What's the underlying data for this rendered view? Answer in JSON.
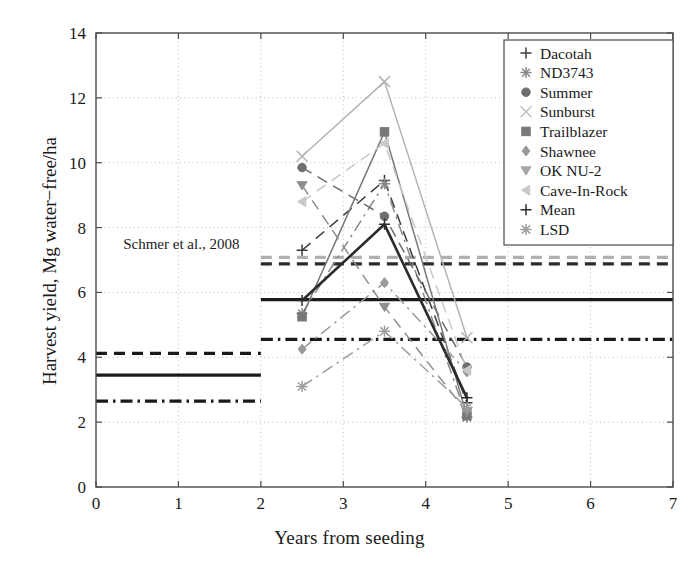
{
  "chart_data": {
    "type": "line",
    "title": "",
    "xlabel": "Years from seeding",
    "ylabel": "Harvest yield, Mg water−free/ha",
    "xlim": [
      0,
      7
    ],
    "ylim": [
      0,
      14
    ],
    "xticks": [
      "0",
      "1",
      "2",
      "3",
      "4",
      "5",
      "6",
      "7"
    ],
    "yticks": [
      "0",
      "2",
      "4",
      "6",
      "8",
      "10",
      "12",
      "14"
    ],
    "xtick_values": [
      0,
      1,
      2,
      3,
      4,
      5,
      6,
      7
    ],
    "ytick_values": [
      0,
      2,
      4,
      6,
      8,
      10,
      12,
      14
    ],
    "grid": "dotted-both-axes",
    "legend_position": "upper right",
    "x": [
      2.5,
      3.5,
      4.5
    ],
    "series": [
      {
        "name": "Dacotah",
        "marker": "plus",
        "color": "#3c3c3c",
        "linestyle": "dashed",
        "values": [
          7.3,
          9.45,
          2.6
        ]
      },
      {
        "name": "ND3743",
        "marker": "asterisk",
        "color": "#8a8a8a",
        "linestyle": "dashdot",
        "values": [
          5.35,
          9.35,
          2.15
        ]
      },
      {
        "name": "Summer",
        "marker": "circle",
        "color": "#6e6e6e",
        "linestyle": "dashed",
        "values": [
          9.85,
          8.35,
          3.7
        ]
      },
      {
        "name": "Sunburst",
        "marker": "x",
        "color": "#b4b4b4",
        "linestyle": "solid",
        "values": [
          10.2,
          12.5,
          4.6
        ]
      },
      {
        "name": "Trailblazer",
        "marker": "square",
        "color": "#787878",
        "linestyle": "solid",
        "values": [
          5.25,
          10.95,
          2.2
        ]
      },
      {
        "name": "Shawnee",
        "marker": "diamond",
        "color": "#9a9a9a",
        "linestyle": "dashdot",
        "values": [
          4.25,
          6.3,
          3.55
        ]
      },
      {
        "name": "OK NU-2",
        "marker": "triangle-down",
        "color": "#8e8e8e",
        "linestyle": "dashed",
        "values": [
          9.3,
          5.55,
          2.3
        ]
      },
      {
        "name": "Cave-In-Rock",
        "marker": "triangle-left",
        "color": "#c8c8c8",
        "linestyle": "dashed",
        "values": [
          8.8,
          10.6,
          3.6
        ]
      },
      {
        "name": "Mean",
        "marker": "plus",
        "color": "#2b2b2b",
        "linestyle": "solid",
        "values": [
          5.75,
          8.1,
          2.75
        ]
      },
      {
        "name": "LSD",
        "marker": "star",
        "color": "#9e9e9e",
        "linestyle": "dashdot",
        "values": [
          3.1,
          4.8,
          2.45
        ]
      }
    ],
    "reference_lines": [
      {
        "id": "left-dashed",
        "x_start": 0,
        "x_end": 2,
        "y": 4.12,
        "color": "#1a1a1a",
        "linestyle": "dashed",
        "width": 3.2
      },
      {
        "id": "left-solid",
        "x_start": 0,
        "x_end": 2,
        "y": 3.45,
        "color": "#1a1a1a",
        "linestyle": "solid",
        "width": 3.2
      },
      {
        "id": "left-dashdot",
        "x_start": 0,
        "x_end": 2,
        "y": 2.65,
        "color": "#1a1a1a",
        "linestyle": "dashdot",
        "width": 3.2
      },
      {
        "id": "right-dashed-light",
        "x_start": 2,
        "x_end": 7,
        "y": 7.08,
        "color": "#b0b0b0",
        "linestyle": "dashed",
        "width": 3.2
      },
      {
        "id": "right-dashed-dark",
        "x_start": 2,
        "x_end": 7,
        "y": 6.88,
        "color": "#2b2b2b",
        "linestyle": "dashed",
        "width": 3.4
      },
      {
        "id": "right-solid",
        "x_start": 2,
        "x_end": 7,
        "y": 5.78,
        "color": "#1a1a1a",
        "linestyle": "solid",
        "width": 3.2
      },
      {
        "id": "right-dashdot",
        "x_start": 2,
        "x_end": 7,
        "y": 4.55,
        "color": "#1a1a1a",
        "linestyle": "dashdot",
        "width": 3.2
      }
    ],
    "annotations": [
      {
        "id": "citation",
        "text": "Schmer et al., 2008",
        "x": 0.33,
        "y": 7.35
      }
    ]
  },
  "legend": {
    "entries": [
      {
        "label": "Dacotah",
        "marker": "plus",
        "color": "#3c3c3c"
      },
      {
        "label": "ND3743",
        "marker": "asterisk",
        "color": "#8a8a8a"
      },
      {
        "label": "Summer",
        "marker": "circle",
        "color": "#6e6e6e"
      },
      {
        "label": "Sunburst",
        "marker": "x",
        "color": "#c0c0c0"
      },
      {
        "label": "Trailblazer",
        "marker": "square",
        "color": "#787878"
      },
      {
        "label": "Shawnee",
        "marker": "diamond",
        "color": "#9a9a9a"
      },
      {
        "label": "OK NU-2",
        "marker": "triangle-down",
        "color": "#a6a6a6"
      },
      {
        "label": "Cave-In-Rock",
        "marker": "triangle-left",
        "color": "#c8c8c8"
      },
      {
        "label": "Mean",
        "marker": "plus",
        "color": "#2b2b2b"
      },
      {
        "label": "LSD",
        "marker": "star",
        "color": "#9e9e9e"
      }
    ]
  },
  "axis": {
    "x_label": "Years from seeding",
    "y_label": "Harvest yield, Mg water−free/ha"
  }
}
